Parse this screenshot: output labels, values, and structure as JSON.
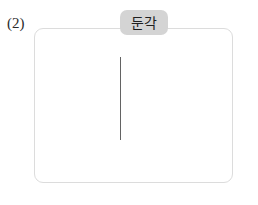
{
  "figure": {
    "index_label": "(2)",
    "title_badge": {
      "label": "둔각",
      "background_color": "#d4d4d4",
      "text_color": "#1f1f1f"
    },
    "panel": {
      "border_color": "#dcdcdc",
      "background_color": "#ffffff"
    },
    "shapes": [
      {
        "name": "vertical-line-segment",
        "type": "line",
        "color": "#636363",
        "x": 120,
        "y1": 57,
        "y2": 140,
        "length": 83,
        "orientation": "vertical"
      }
    ]
  }
}
